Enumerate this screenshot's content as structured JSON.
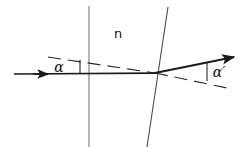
{
  "figure": {
    "kind": "optics-refraction-diagram",
    "background_color": "#ffffff",
    "stroke_color": "#1a1a1a",
    "thin_stroke_color": "#555555",
    "dashed_stroke_color": "#333333"
  },
  "labels": {
    "medium_index": "n",
    "angle_in": "α",
    "angle_out": "α′"
  },
  "surfaces": [
    {
      "name": "first-surface",
      "orientation": "vertical",
      "x_top": 89,
      "y_top": 6,
      "x_bottom": 89,
      "y_bottom": 147
    },
    {
      "name": "second-surface",
      "orientation": "slanted",
      "x_top": 168,
      "y_top": 7,
      "x_bottom": 147,
      "y_bottom": 147
    }
  ],
  "rays": [
    {
      "name": "incident-ray",
      "from": [
        14,
        74
      ],
      "to": [
        155,
        73
      ],
      "arrow_at": [
        46,
        74
      ],
      "style": "solid-thick"
    },
    {
      "name": "exit-ray",
      "from": [
        155,
        73
      ],
      "to": [
        234,
        57
      ],
      "arrow_at": [
        234,
        57
      ],
      "style": "solid-thick"
    }
  ],
  "construction_lines": [
    {
      "name": "incident-angle-dashed-reference",
      "from": [
        48,
        57
      ],
      "to": [
        155,
        73
      ],
      "style": "dashed"
    },
    {
      "name": "exit-angle-dashed-reference",
      "from": [
        155,
        73
      ],
      "to": [
        227,
        88
      ],
      "style": "dashed"
    },
    {
      "name": "incident-angle-tick",
      "from": [
        80,
        60
      ],
      "to": [
        80,
        74
      ],
      "style": "solid-thin"
    },
    {
      "name": "exit-angle-tick",
      "from": [
        207,
        62
      ],
      "to": [
        207,
        81
      ],
      "style": "solid-thin"
    }
  ],
  "label_positions": {
    "medium_index": [
      118,
      38
    ],
    "angle_in": [
      59,
      72
    ],
    "angle_out": [
      212,
      77
    ]
  }
}
